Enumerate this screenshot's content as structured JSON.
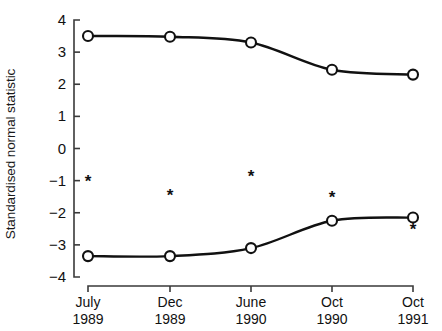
{
  "chart_data": {
    "type": "line",
    "title": "",
    "xlabel": "",
    "ylabel": "Standardised normal statistic",
    "categories": [
      "July 1989",
      "Dec 1989",
      "June 1990",
      "Oct 1990",
      "Oct 1991"
    ],
    "x_tick_months": [
      "July",
      "Dec",
      "June",
      "Oct",
      "Oct"
    ],
    "x_tick_years": [
      "1989",
      "1989",
      "1990",
      "1990",
      "1991"
    ],
    "ylim": [
      -4,
      4
    ],
    "y_ticks": [
      "4",
      "3",
      "2",
      "1",
      "0",
      "-1",
      "-2",
      "-3",
      "-4"
    ],
    "y_tick_values": [
      4,
      3,
      2,
      1,
      0,
      -1,
      -2,
      -3,
      -4
    ],
    "grid": false,
    "legend": "none",
    "series": [
      {
        "name": "upper-curve",
        "marker": "open-circle",
        "values": [
          3.5,
          3.48,
          3.3,
          2.45,
          2.3
        ]
      },
      {
        "name": "lower-curve",
        "marker": "open-circle",
        "values": [
          -3.35,
          -3.35,
          -3.1,
          -2.25,
          -2.15
        ]
      }
    ],
    "annotations": [
      {
        "symbol": "*",
        "x_index": 0,
        "y": -1.0
      },
      {
        "symbol": "*",
        "x_index": 1,
        "y": -1.45
      },
      {
        "symbol": "*",
        "x_index": 2,
        "y": -0.85
      },
      {
        "symbol": "*",
        "x_index": 3,
        "y": -1.5
      },
      {
        "symbol": "*",
        "x_index": 4,
        "y": -2.5
      }
    ]
  },
  "style": {
    "line_color": "#111111",
    "marker_fill": "#ffffff",
    "axis_color": "#3a3a3a",
    "background": "#ffffff"
  }
}
